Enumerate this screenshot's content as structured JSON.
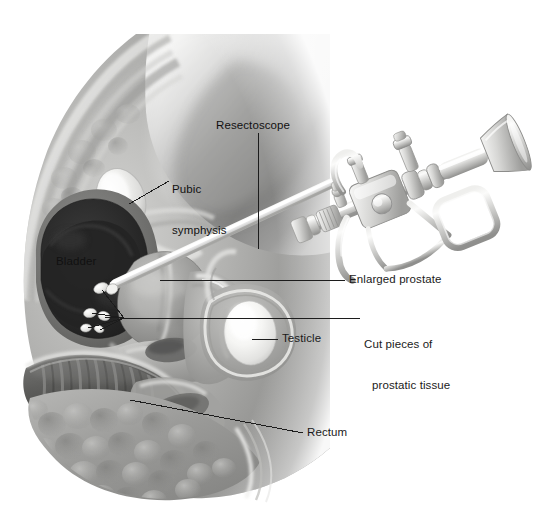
{
  "figure": {
    "type": "medical-illustration",
    "rendering": "grayscale airbrush / medical art",
    "background_color": "#ffffff",
    "width": 557,
    "height": 509
  },
  "labels": [
    {
      "id": "resectoscope",
      "text": "Resectoscope",
      "x": 216,
      "y": 119,
      "align": "left",
      "placement": "outside-top",
      "leader": "vertical line down to instrument shaft"
    },
    {
      "id": "pubic-symphysis",
      "text": "Pubic\nsymphysis",
      "line1": "Pubic",
      "line2": "symphysis",
      "x": 172,
      "y": 162,
      "align": "left",
      "placement": "on-art",
      "leader": "diagonal line down-left to pubic bone"
    },
    {
      "id": "bladder",
      "text": "Bladder",
      "x": 56,
      "y": 255,
      "align": "left",
      "placement": "on-art-inside",
      "leader": "none"
    },
    {
      "id": "enlarged-prostate",
      "text": "Enlarged prostate",
      "x": 349,
      "y": 275,
      "align": "left",
      "placement": "outside-right",
      "leader": "horizontal line left to prostate"
    },
    {
      "id": "cut-pieces",
      "text": "Cut pieces of\nprostatic tissue",
      "line1": "Cut pieces of",
      "line2": "prostatic tissue",
      "x": 364,
      "y": 311,
      "align": "left",
      "placement": "outside-right",
      "leader": "horizontal line branching to tissue fragments"
    },
    {
      "id": "testicle",
      "text": "Testicle",
      "x": 282,
      "y": 334,
      "align": "left",
      "placement": "outside-right",
      "leader": "short horizontal line left to testicle"
    },
    {
      "id": "rectum",
      "text": "Rectum",
      "x": 307,
      "y": 428,
      "align": "left",
      "placement": "outside-right",
      "leader": "long horizontal line left to rectum"
    }
  ],
  "anatomy": [
    {
      "id": "abdominal-wall",
      "name": "Abdominal wall",
      "tone": "#8f8f8f"
    },
    {
      "id": "pubic-symphysis-bone",
      "name": "Pubic symphysis",
      "tone": "#ededec"
    },
    {
      "id": "bladder",
      "name": "Bladder",
      "tone": "#2e2e2e"
    },
    {
      "id": "prostate",
      "name": "Enlarged prostate",
      "tone": "#9a9a9a"
    },
    {
      "id": "cut-tissue",
      "name": "Cut pieces of prostatic tissue",
      "tone": "#f2f2f0"
    },
    {
      "id": "testicle",
      "name": "Testicle",
      "tone": "#f6f6f4"
    },
    {
      "id": "scrotum",
      "name": "Scrotum",
      "tone": "#a8a8a8"
    },
    {
      "id": "rectum",
      "name": "Rectum",
      "tone": "#6a6a6a"
    },
    {
      "id": "gluteal-tissue",
      "name": "Gluteal / fatty tissue",
      "tone": "#9d9d9d"
    },
    {
      "id": "penis-urethra",
      "name": "Penis and urethra",
      "tone": "#a5a5a5"
    }
  ],
  "instrument": {
    "id": "resectoscope",
    "name": "Resectoscope",
    "tone": "#d8d8d6",
    "parts": [
      "sheath/shaft",
      "working element",
      "thumb ring",
      "trigger lever",
      "finger ring handle",
      "light post",
      "irrigation stopcock",
      "telescope eyepiece"
    ]
  },
  "colors": {
    "background": "#ffffff",
    "label_text": "#1a1a1a",
    "leader_line": "#1c1c1c",
    "instrument_light": "#e6e6e4",
    "instrument_mid": "#b9b9b7",
    "instrument_dark": "#8d8d8b",
    "tissue_light": "#c9c9c7",
    "tissue_mid": "#9a9a98",
    "tissue_dark": "#5e5e5c",
    "bladder_dark": "#2b2b2b",
    "highlight": "#f7f7f5"
  },
  "caption": {
    "text": "",
    "visible": false
  }
}
